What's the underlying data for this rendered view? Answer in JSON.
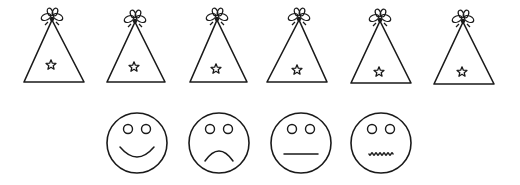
{
  "colors": {
    "background": "#ffffff",
    "ink": "#1a1a1a"
  },
  "hats": [
    {
      "name": "party-hat-1",
      "apex_x": 52,
      "apex_y": 20,
      "base_left": 24,
      "base_right": 84,
      "base_y": 82,
      "star_x": 51,
      "star_y": 65
    },
    {
      "name": "party-hat-2",
      "apex_x": 135,
      "apex_y": 22,
      "base_left": 107,
      "base_right": 165,
      "base_y": 82,
      "star_x": 134,
      "star_y": 67
    },
    {
      "name": "party-hat-3",
      "apex_x": 217,
      "apex_y": 20,
      "base_left": 190,
      "base_right": 247,
      "base_y": 82,
      "star_x": 216,
      "star_y": 69
    },
    {
      "name": "party-hat-4",
      "apex_x": 299,
      "apex_y": 20,
      "base_left": 267,
      "base_right": 327,
      "base_y": 82,
      "star_x": 297,
      "star_y": 70
    },
    {
      "name": "party-hat-5",
      "apex_x": 380,
      "apex_y": 21,
      "base_left": 351,
      "base_right": 411,
      "base_y": 83,
      "star_x": 379,
      "star_y": 72
    },
    {
      "name": "party-hat-6",
      "apex_x": 463,
      "apex_y": 22,
      "base_left": 434,
      "base_right": 494,
      "base_y": 84,
      "star_x": 462,
      "star_y": 72
    }
  ],
  "faces": [
    {
      "name": "happy-face",
      "expression": "smile",
      "cx": 137,
      "cy": 143,
      "r": 30
    },
    {
      "name": "sad-face",
      "expression": "frown",
      "cx": 219,
      "cy": 143,
      "r": 30
    },
    {
      "name": "neutral-face",
      "expression": "flat",
      "cx": 301,
      "cy": 143,
      "r": 30
    },
    {
      "name": "queasy-face",
      "expression": "wavy",
      "cx": 381,
      "cy": 143,
      "r": 30
    }
  ]
}
